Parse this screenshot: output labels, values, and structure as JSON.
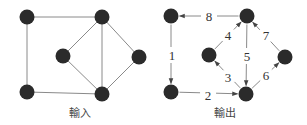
{
  "figure": {
    "input_graph": {
      "caption": "輸入",
      "caption_pos": [
        80,
        113
      ],
      "nodes": [
        {
          "id": "A",
          "x": 27,
          "y": 17
        },
        {
          "id": "B",
          "x": 102,
          "y": 17
        },
        {
          "id": "C",
          "x": 63,
          "y": 56
        },
        {
          "id": "D",
          "x": 139,
          "y": 57
        },
        {
          "id": "E",
          "x": 27,
          "y": 92
        },
        {
          "id": "F",
          "x": 102,
          "y": 94
        }
      ],
      "edges": [
        [
          "A",
          "B"
        ],
        [
          "A",
          "E"
        ],
        [
          "E",
          "F"
        ],
        [
          "B",
          "F"
        ],
        [
          "B",
          "C"
        ],
        [
          "C",
          "F"
        ],
        [
          "B",
          "D"
        ],
        [
          "D",
          "F"
        ]
      ]
    },
    "output_graph": {
      "caption": "輸出",
      "caption_pos": [
        225,
        113
      ],
      "nodes": [
        {
          "id": "A",
          "x": 171,
          "y": 16
        },
        {
          "id": "B",
          "x": 247,
          "y": 16
        },
        {
          "id": "C",
          "x": 209,
          "y": 55
        },
        {
          "id": "D",
          "x": 285,
          "y": 57
        },
        {
          "id": "E",
          "x": 171,
          "y": 92
        },
        {
          "id": "F",
          "x": 246,
          "y": 94
        }
      ],
      "edges": [
        {
          "order": "1",
          "from": "A",
          "to": "E",
          "label_pos": [
            172,
            55
          ]
        },
        {
          "order": "2",
          "from": "E",
          "to": "F",
          "label_pos": [
            208,
            95
          ]
        },
        {
          "order": "3",
          "from": "F",
          "to": "C",
          "label_pos": [
            228,
            77
          ]
        },
        {
          "order": "4",
          "from": "C",
          "to": "B",
          "label_pos": [
            228,
            35
          ]
        },
        {
          "order": "5",
          "from": "B",
          "to": "F",
          "label_pos": [
            247,
            56
          ]
        },
        {
          "order": "6",
          "from": "F",
          "to": "D",
          "label_pos": [
            266,
            75
          ]
        },
        {
          "order": "7",
          "from": "D",
          "to": "B",
          "label_pos": [
            266,
            35
          ]
        },
        {
          "order": "8",
          "from": "B",
          "to": "A",
          "label_pos": [
            209,
            16
          ]
        }
      ]
    },
    "colors": {
      "node": "#2b2b2b",
      "edge": "#8a8a8a",
      "text": "#333333"
    }
  }
}
